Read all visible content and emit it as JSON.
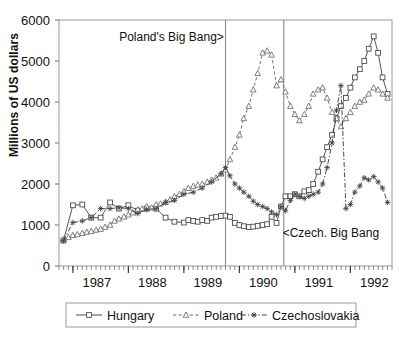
{
  "chart_data": {
    "type": "line",
    "title": "",
    "xlabel": "",
    "ylabel": "Millions of US dollars",
    "ylim": [
      0,
      6000
    ],
    "ytick_labels": [
      "0",
      "1000",
      "2000",
      "3000",
      "4000",
      "5000",
      "6000"
    ],
    "yticks": [
      0,
      1000,
      2000,
      3000,
      4000,
      5000,
      6000
    ],
    "xlim": [
      1986.75,
      1992.75
    ],
    "xtick_labels": [
      "1987",
      "1988",
      "1989",
      "1990",
      "1991",
      "1992"
    ],
    "xticks": [
      1987,
      1988,
      1989,
      1990,
      1991,
      1992
    ],
    "x_minor_interval": "monthly",
    "grid": false,
    "legend_position": "below-bottom",
    "annotations": [
      {
        "text": "Poland's Big Bang>",
        "x": 1989.72,
        "y": 5500,
        "anchor": "end"
      },
      {
        "text": "<Czech. Big Bang",
        "x": 1990.78,
        "y": 700,
        "anchor": "start"
      }
    ],
    "vlines": [
      {
        "x": 1989.75,
        "label": "Poland's Big Bang"
      },
      {
        "x": 1990.8,
        "label": "Czech. Big Bang"
      }
    ],
    "series": [
      {
        "name": "Hungary",
        "marker": "square",
        "line": "solid",
        "color": "#4d4d4d",
        "x": [
          1986.83,
          1987.0,
          1987.17,
          1987.33,
          1987.5,
          1987.67,
          1987.83,
          1988.0,
          1988.17,
          1988.33,
          1988.5,
          1988.67,
          1988.83,
          1989.0,
          1989.08,
          1989.17,
          1989.25,
          1989.33,
          1989.42,
          1989.5,
          1989.58,
          1989.67,
          1989.75,
          1989.83,
          1989.92,
          1990.0,
          1990.08,
          1990.17,
          1990.25,
          1990.33,
          1990.42,
          1990.5,
          1990.58,
          1990.67,
          1990.75,
          1990.83,
          1990.92,
          1991.0,
          1991.08,
          1991.17,
          1991.25,
          1991.33,
          1991.42,
          1991.5,
          1991.58,
          1991.67,
          1991.75,
          1991.83,
          1991.92,
          1992.0,
          1992.08,
          1992.17,
          1992.25,
          1992.33,
          1992.42,
          1992.5,
          1992.58,
          1992.67
        ],
        "y": [
          620,
          1480,
          1500,
          1180,
          1180,
          1550,
          1400,
          1480,
          1350,
          1400,
          1400,
          1180,
          1080,
          1060,
          1120,
          1100,
          1080,
          1120,
          1100,
          1180,
          1200,
          1220,
          1230,
          1200,
          1050,
          1000,
          970,
          950,
          960,
          980,
          1000,
          1020,
          1200,
          1050,
          1450,
          1700,
          1700,
          1750,
          1700,
          1820,
          1850,
          2000,
          2300,
          2600,
          2900,
          3200,
          3600,
          3900,
          4100,
          4350,
          4600,
          4800,
          5000,
          5300,
          5600,
          5200,
          4600,
          4200
        ]
      },
      {
        "name": "Poland",
        "marker": "triangle",
        "line": "dashed",
        "color": "#6a6a6a",
        "x": [
          1986.83,
          1986.92,
          1987.0,
          1987.08,
          1987.17,
          1987.25,
          1987.33,
          1987.42,
          1987.5,
          1987.58,
          1987.67,
          1987.75,
          1987.83,
          1987.92,
          1988.0,
          1988.08,
          1988.17,
          1988.25,
          1988.33,
          1988.42,
          1988.5,
          1988.58,
          1988.67,
          1988.75,
          1988.83,
          1988.92,
          1989.0,
          1989.08,
          1989.17,
          1989.25,
          1989.33,
          1989.42,
          1989.5,
          1989.58,
          1989.67,
          1989.75,
          1989.83,
          1989.92,
          1990.0,
          1990.08,
          1990.17,
          1990.25,
          1990.33,
          1990.42,
          1990.5,
          1990.58,
          1990.67,
          1990.75,
          1990.83,
          1990.92,
          1991.0,
          1991.08,
          1991.17,
          1991.25,
          1991.33,
          1991.42,
          1991.5,
          1991.58,
          1991.67,
          1991.75,
          1991.83,
          1991.92,
          1992.0,
          1992.08,
          1992.17,
          1992.25,
          1992.33,
          1992.42,
          1992.5,
          1992.58,
          1992.67
        ],
        "y": [
          650,
          700,
          750,
          770,
          800,
          830,
          850,
          880,
          900,
          950,
          1000,
          1100,
          1150,
          1200,
          1250,
          1300,
          1380,
          1400,
          1450,
          1420,
          1500,
          1520,
          1560,
          1620,
          1700,
          1750,
          1820,
          1900,
          1950,
          1980,
          2000,
          2050,
          2100,
          2150,
          2250,
          2350,
          2600,
          2900,
          3200,
          3600,
          3900,
          4300,
          4700,
          5200,
          5250,
          5150,
          4400,
          4550,
          4250,
          3900,
          3700,
          3550,
          3700,
          3900,
          4200,
          4300,
          4350,
          4100,
          3750,
          3600,
          3400,
          3600,
          3750,
          3900,
          4000,
          4050,
          4200,
          4350,
          4300,
          4200,
          4100
        ]
      },
      {
        "name": "Czechoslovakia",
        "marker": "star",
        "line": "dashdot",
        "color": "#3f3f3f",
        "x": [
          1986.83,
          1987.0,
          1987.17,
          1987.33,
          1987.5,
          1987.67,
          1987.83,
          1988.0,
          1988.17,
          1988.33,
          1988.5,
          1988.67,
          1988.83,
          1989.0,
          1989.17,
          1989.33,
          1989.5,
          1989.67,
          1989.75,
          1989.83,
          1989.92,
          1990.0,
          1990.08,
          1990.17,
          1990.25,
          1990.33,
          1990.42,
          1990.5,
          1990.58,
          1990.67,
          1990.75,
          1990.83,
          1990.92,
          1991.0,
          1991.08,
          1991.17,
          1991.25,
          1991.33,
          1991.42,
          1991.5,
          1991.58,
          1991.67,
          1991.75,
          1991.83,
          1991.92,
          1992.0,
          1992.08,
          1992.17,
          1992.25,
          1992.33,
          1992.42,
          1992.5,
          1992.58,
          1992.67
        ],
        "y": [
          620,
          1060,
          1100,
          1180,
          1400,
          1400,
          1420,
          1400,
          1280,
          1380,
          1400,
          1550,
          1600,
          1750,
          1800,
          1900,
          2050,
          2250,
          2400,
          2200,
          2000,
          1900,
          1800,
          1700,
          1580,
          1500,
          1450,
          1400,
          1320,
          1250,
          1450,
          1350,
          1600,
          1750,
          1700,
          1650,
          1700,
          1750,
          1800,
          2000,
          2400,
          3000,
          3800,
          4400,
          1400,
          1500,
          1800,
          1950,
          2150,
          2100,
          2180,
          2050,
          1900,
          1550
        ]
      }
    ]
  },
  "legend": {
    "items": [
      {
        "label": "Hungary",
        "marker": "square",
        "line": "solid"
      },
      {
        "label": "Poland",
        "marker": "triangle",
        "line": "dashed"
      },
      {
        "label": "Czechoslovakia",
        "marker": "star",
        "line": "dashdot"
      }
    ]
  }
}
